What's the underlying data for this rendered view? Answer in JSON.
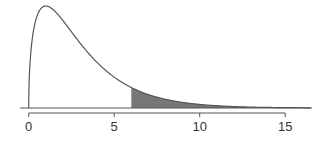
{
  "chart_data": {
    "type": "area",
    "title": "",
    "xlabel": "",
    "ylabel": "",
    "distribution": "chi-square",
    "degrees_of_freedom": 3,
    "shaded_region": {
      "from": 6,
      "to": 16.5,
      "color": "#777777"
    },
    "xlim": [
      0,
      16.5
    ],
    "x_ticks": [
      0,
      5,
      10,
      15
    ],
    "x_tick_labels": [
      "0",
      "5",
      "10",
      "15"
    ],
    "grid": false,
    "legend": null,
    "colors": {
      "curve": "#555555",
      "fill": "#777777",
      "axis": "#555555"
    }
  }
}
